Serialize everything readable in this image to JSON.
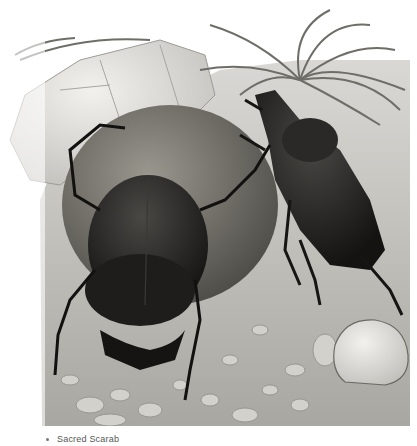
{
  "figure": {
    "style": "grayscale illustration",
    "colors": {
      "background": "#ffffff",
      "ground": "#b8b6b0",
      "pebbles": "#d6d4ce",
      "ball": "#6f6c66",
      "beetle": "#1b1a19",
      "rock": "#e4e3df",
      "grass": "#8a8883"
    }
  },
  "caption": {
    "text": "Sacred Scarab"
  }
}
